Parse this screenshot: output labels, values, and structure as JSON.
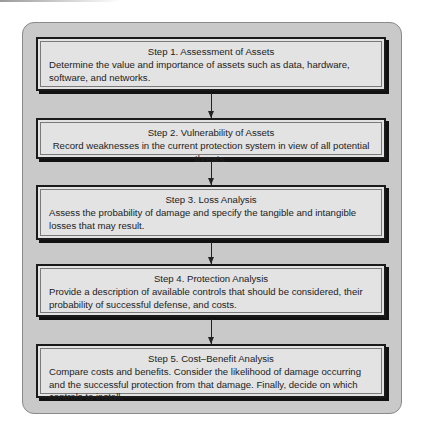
{
  "diagram": {
    "type": "flowchart",
    "steps": [
      {
        "title": "Step 1.  Assessment of Assets",
        "description": "Determine the value and importance of assets such as data, hardware, software, and networks."
      },
      {
        "title": "Step 2.  Vulnerability of Assets",
        "description": "Record weaknesses in the current protection system in view of all potential threats."
      },
      {
        "title": "Step 3.  Loss Analysis",
        "description": "Assess the probability of damage and specify the tangible and intangible losses that may result."
      },
      {
        "title": "Step 4.  Protection Analysis",
        "description": "Provide a description of available controls that should be considered, their probability of successful defense, and costs."
      },
      {
        "title": "Step 5.  Cost–Benefit Analysis",
        "description": "Compare costs and benefits. Consider the likelihood of damage occurring and the successful protection from that damage. Finally, decide on which controls to install."
      }
    ],
    "connectors": [
      "step1-to-step2",
      "step2-to-step3",
      "step3-to-step4",
      "step4-to-step5"
    ],
    "colors": {
      "container_fill": "#c9c9c9",
      "box_fill": "#e3e3e3",
      "border": "#1a1a1a"
    }
  }
}
